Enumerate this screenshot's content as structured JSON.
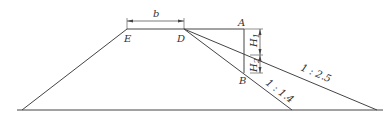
{
  "diagram": {
    "type": "embankment-cross-section",
    "points": {
      "E": "E",
      "D": "D",
      "A": "A",
      "B": "B"
    },
    "dimensions": {
      "top_width": "b",
      "h1": "H",
      "h1_sub": "1",
      "h2": "H",
      "h2_sub": "2"
    },
    "slopes": {
      "steep": "1 : 1.4",
      "gentle": "1 : 2.5"
    },
    "colors": {
      "line": "#444444",
      "text": "#333333"
    }
  }
}
